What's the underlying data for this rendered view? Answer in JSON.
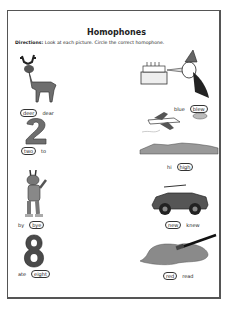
{
  "worksheet": {
    "title": "Homophones",
    "directions_label": "Directions:",
    "directions_text": " Look at each picture. Circle the correct homophone."
  },
  "items": [
    {
      "picture": "deer-icon",
      "options": [
        "deer",
        "dear"
      ],
      "circled": "deer"
    },
    {
      "picture": "party-dog-blowing-horn-at-cake-icon",
      "options": [
        "blue",
        "blew"
      ],
      "circled": "blew"
    },
    {
      "picture": "number-two-icon",
      "options": [
        "two",
        "to"
      ],
      "circled": "two"
    },
    {
      "picture": "airplane-over-town-icon",
      "options": [
        "hi",
        "high"
      ],
      "circled": "high"
    },
    {
      "picture": "waving-rabbit-icon",
      "options": [
        "by",
        "bye"
      ],
      "circled": "bye"
    },
    {
      "picture": "new-car-icon",
      "options": [
        "new",
        "knew"
      ],
      "circled": "new"
    },
    {
      "picture": "number-eight-icon",
      "options": [
        "ate",
        "eight"
      ],
      "circled": "eight"
    },
    {
      "picture": "red-paint-spill-icon",
      "options": [
        "red",
        "read"
      ],
      "circled": "red"
    }
  ],
  "colors": {
    "ink": "#222222",
    "gray_fill": "#6e6e6e",
    "border": "#555555"
  }
}
